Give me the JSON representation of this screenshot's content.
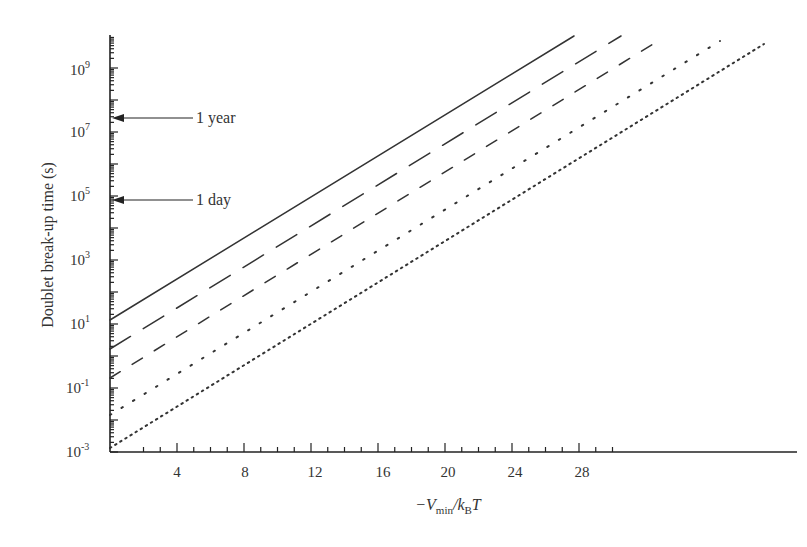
{
  "chart_data": {
    "type": "line",
    "title": "",
    "xlabel": "−V_min/k_B T",
    "ylabel": "Doublet break-up time (s)",
    "x_ticks": [
      "4",
      "8",
      "12",
      "16",
      "20",
      "24",
      "28"
    ],
    "y_ticks": [
      "10^-3",
      "10^-1",
      "10^1",
      "10^3",
      "10^5",
      "10^7",
      "10^9"
    ],
    "xlim": [
      1.25,
      30
    ],
    "ylim": [
      0.001,
      10000000000
    ],
    "yscale": "log",
    "grid": false,
    "annotations": [
      {
        "text": "1 year",
        "y": 31536000
      },
      {
        "text": "1 day",
        "y": 86400
      }
    ],
    "series": [
      {
        "name": "solid",
        "style": "solid",
        "x": [
          1.25,
          20.3
        ],
        "y": [
          13,
          10000000000.0
        ]
      },
      {
        "name": "long-dash",
        "style": "long-dash",
        "x": [
          1.25,
          22.3
        ],
        "y": [
          1.6,
          10000000000.0
        ]
      },
      {
        "name": "medium-dash",
        "style": "dash",
        "x": [
          1.25,
          23.8
        ],
        "y": [
          0.2,
          7000000000.0
        ]
      },
      {
        "name": "sparse-dot",
        "style": "dotted-sparse",
        "x": [
          1.25,
          26.3
        ],
        "y": [
          0.015,
          7000000000.0
        ]
      },
      {
        "name": "dense-dot",
        "style": "dotted-dense",
        "x": [
          1.25,
          28.1
        ],
        "y": [
          0.0013,
          5000000000.0
        ]
      }
    ]
  },
  "labels": {
    "ylabel": "Doublet break-up time (s)",
    "xlabel_prefix": "−V",
    "xlabel_sub1": "min",
    "xlabel_mid": "/k",
    "xlabel_sub2": "B",
    "xlabel_suffix": "T",
    "ann_year": "1 year",
    "ann_day": "1 day",
    "x": [
      "4",
      "8",
      "12",
      "16",
      "20",
      "24",
      "28"
    ],
    "y_base": [
      "10",
      "10",
      "10",
      "10",
      "10",
      "10",
      "10"
    ],
    "y_exp": [
      "-3",
      "-1",
      "1",
      "3",
      "5",
      "7",
      "9"
    ]
  }
}
